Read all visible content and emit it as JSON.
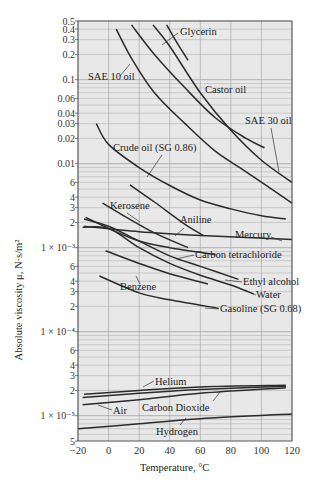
{
  "chart_data": {
    "type": "line",
    "title": "",
    "xlabel": "Temperature, °C",
    "ylabel": "Absolute viscosity μ, N·s/m²",
    "yscale": "log",
    "xlim": [
      -20,
      120
    ],
    "ylim": [
      5e-06,
      0.5
    ],
    "grid": true,
    "x_ticks": [
      -20,
      0,
      20,
      40,
      60,
      80,
      100,
      120
    ],
    "x_tick_labels": [
      "−20",
      "0",
      "20",
      "40",
      "60",
      "80",
      "100",
      "120"
    ],
    "y_ticks": [
      {
        "v": 0.5,
        "label": "0.5"
      },
      {
        "v": 0.4,
        "label": "0.4"
      },
      {
        "v": 0.3,
        "label": "0.3"
      },
      {
        "v": 0.2,
        "label": "0.2"
      },
      {
        "v": 0.1,
        "label": "0.1"
      },
      {
        "v": 0.06,
        "label": "0.06"
      },
      {
        "v": 0.04,
        "label": "0.04"
      },
      {
        "v": 0.03,
        "label": "0.03"
      },
      {
        "v": 0.02,
        "label": "0.02"
      },
      {
        "v": 0.01,
        "label": "0.01"
      },
      {
        "v": 0.006,
        "label": "6"
      },
      {
        "v": 0.004,
        "label": "4"
      },
      {
        "v": 0.003,
        "label": "3"
      },
      {
        "v": 0.002,
        "label": "2"
      },
      {
        "v": 0.001,
        "label": "1 × 10⁻³"
      },
      {
        "v": 0.0006,
        "label": "6"
      },
      {
        "v": 0.0004,
        "label": "4"
      },
      {
        "v": 0.0003,
        "label": "3"
      },
      {
        "v": 0.0002,
        "label": "2"
      },
      {
        "v": 0.0001,
        "label": "1 × 10⁻⁴"
      },
      {
        "v": 6e-05,
        "label": "6"
      },
      {
        "v": 4e-05,
        "label": "4"
      },
      {
        "v": 3e-05,
        "label": "3"
      },
      {
        "v": 2e-05,
        "label": "2"
      },
      {
        "v": 1e-05,
        "label": "1 × 10⁻⁵"
      },
      {
        "v": 5e-06,
        "label": "5"
      }
    ],
    "series": [
      {
        "name": "Glycerin",
        "x": [
          38,
          45,
          52
        ],
        "values": [
          0.45,
          0.27,
          0.17
        ],
        "label_pos": [
          180,
          35
        ],
        "leader": [
          [
            178,
            33
          ],
          [
            162,
            45
          ]
        ]
      },
      {
        "name": "SAE 10 oil",
        "x": [
          5,
          15,
          30,
          50,
          70,
          90,
          120
        ],
        "values": [
          0.4,
          0.18,
          0.07,
          0.03,
          0.014,
          0.008,
          0.0034
        ],
        "label_pos": [
          88,
          80
        ],
        "leader": [
          [
            120,
            76
          ],
          [
            130,
            64
          ]
        ]
      },
      {
        "name": "Castor oil",
        "x": [
          15,
          30,
          50,
          70,
          90,
          102
        ],
        "values": [
          0.45,
          0.2,
          0.08,
          0.035,
          0.02,
          0.0155
        ],
        "label_pos": [
          205,
          93
        ],
        "leader": []
      },
      {
        "name": "SAE 30 oil",
        "x": [
          29,
          40,
          60,
          80,
          100,
          120
        ],
        "values": [
          0.45,
          0.25,
          0.07,
          0.025,
          0.011,
          0.006
        ],
        "label_pos": [
          245,
          124
        ],
        "leader": [
          [
            271,
            128
          ],
          [
            279,
            172
          ]
        ]
      },
      {
        "name": "Crude oil (SG 0.86)",
        "x": [
          -8,
          0,
          20,
          40,
          60,
          80,
          100,
          116
        ],
        "values": [
          0.03,
          0.017,
          0.009,
          0.0055,
          0.0037,
          0.0029,
          0.0024,
          0.0022
        ],
        "label_pos": [
          113,
          151
        ],
        "leader": [
          [
            162,
            155
          ],
          [
            147,
            177
          ]
        ]
      },
      {
        "name": "Kerosene",
        "x": [
          -4,
          10,
          30,
          52
        ],
        "values": [
          0.0034,
          0.0024,
          0.0015,
          0.001
        ],
        "label_pos": [
          110,
          209
        ],
        "leader": [
          [
            127,
            213
          ],
          [
            140,
            222
          ]
        ]
      },
      {
        "name": "Aniline",
        "x": [
          14,
          30,
          50,
          62
        ],
        "values": [
          0.0056,
          0.0035,
          0.0019,
          0.0014
        ],
        "label_pos": [
          180,
          223
        ],
        "leader": [
          [
            184,
            228
          ],
          [
            175,
            236
          ]
        ]
      },
      {
        "name": "Mercury",
        "x": [
          -16,
          20,
          60,
          120
        ],
        "values": [
          0.0018,
          0.00155,
          0.0014,
          0.00125
        ],
        "label_pos": [
          235,
          238
        ],
        "leader": [
          [
            271,
            237
          ],
          [
            282,
            241
          ]
        ]
      },
      {
        "name": "Carbon tetrachloride",
        "x": [
          -15,
          0,
          20,
          40,
          70
        ],
        "values": [
          0.0023,
          0.0017,
          0.0012,
          0.001,
          0.00083
        ],
        "label_pos": [
          195,
          258
        ],
        "leader": [
          [
            194,
            255
          ],
          [
            176,
            259
          ]
        ]
      },
      {
        "name": "Ethyl alcohol",
        "x": [
          -16,
          0,
          20,
          40,
          60,
          85
        ],
        "values": [
          0.0022,
          0.0018,
          0.0012,
          0.0008,
          0.0006,
          0.00042
        ],
        "label_pos": [
          243,
          285
        ],
        "leader": [
          [
            242,
            282
          ],
          [
            225,
            280
          ]
        ]
      },
      {
        "name": "Water",
        "x": [
          -17,
          0,
          20,
          40,
          60,
          80,
          95
        ],
        "values": [
          0.00175,
          0.0017,
          0.001,
          0.00065,
          0.00047,
          0.00036,
          0.00028
        ],
        "label_pos": [
          256,
          298
        ],
        "leader": [
          [
            256,
            295
          ],
          [
            245,
            290
          ]
        ]
      },
      {
        "name": "Benzene",
        "x": [
          -2,
          20,
          40,
          65
        ],
        "values": [
          0.00092,
          0.00065,
          0.00049,
          0.00037
        ],
        "label_pos": [
          120,
          290
        ],
        "leader": [
          [
            140,
            284
          ],
          [
            136,
            276
          ]
        ]
      },
      {
        "name": "Gasoline (SG 0.68)",
        "x": [
          -6,
          20,
          40,
          72
        ],
        "values": [
          0.00046,
          0.00029,
          0.00024,
          0.00019
        ],
        "label_pos": [
          220,
          312
        ],
        "leader": [
          [
            219,
            309
          ],
          [
            205,
            308
          ]
        ]
      },
      {
        "name": "Helium",
        "x": [
          -16,
          20,
          60,
          116
        ],
        "values": [
          1.8e-05,
          2e-05,
          2.2e-05,
          2.3e-05
        ],
        "label_pos": [
          155,
          385
        ],
        "leader": [
          [
            154,
            381
          ],
          [
            143,
            387
          ]
        ]
      },
      {
        "name": "Air",
        "x": [
          -17,
          20,
          60,
          116
        ],
        "values": [
          1.65e-05,
          1.85e-05,
          2.05e-05,
          2.25e-05
        ],
        "label_pos": [
          113,
          414
        ],
        "leader": [
          [
            112,
            410
          ],
          [
            98,
            405
          ]
        ]
      },
      {
        "name": "Carbon Dioxide",
        "x": [
          -17,
          20,
          60,
          116
        ],
        "values": [
          1.35e-05,
          1.55e-05,
          1.85e-05,
          2.15e-05
        ],
        "label_pos": [
          142,
          411
        ],
        "leader": [
          [
            213,
            401
          ],
          [
            220,
            392
          ]
        ]
      },
      {
        "name": "Hydrogen",
        "x": [
          -20,
          20,
          60,
          120
        ],
        "values": [
          7e-06,
          8e-06,
          9.2e-06,
          1.05e-05
        ],
        "label_pos": [
          156,
          435
        ],
        "leader": [
          [
            180,
            425
          ],
          [
            186,
            418
          ]
        ]
      }
    ],
    "colors": {
      "curve": "#2b2b2b",
      "grid": "#a8a8a8",
      "plot_bg": "#e8e8e8",
      "axis": "#555555"
    }
  }
}
